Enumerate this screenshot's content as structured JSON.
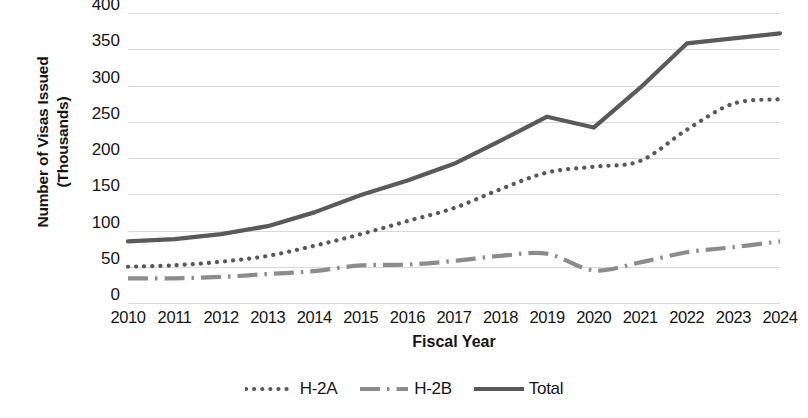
{
  "chart_data": {
    "type": "line",
    "title": "",
    "xlabel": "Fiscal Year",
    "ylabel": "Number of Visas Issued (Thousands)",
    "ylabel_line1": "Number of Visas Issued",
    "ylabel_line2": "(Thousands)",
    "categories": [
      "2010",
      "2011",
      "2012",
      "2013",
      "2014",
      "2015",
      "2016",
      "2017",
      "2018",
      "2019",
      "2020",
      "2021",
      "2022",
      "2023",
      "2024"
    ],
    "x": [
      2010,
      2011,
      2012,
      2013,
      2014,
      2015,
      2016,
      2017,
      2018,
      2019,
      2020,
      2021,
      2022,
      2023,
      2024
    ],
    "ylim": [
      0,
      400
    ],
    "yticks": [
      0,
      50,
      100,
      150,
      200,
      250,
      300,
      350,
      400
    ],
    "ytick_labels": [
      "0",
      "50",
      "100",
      "150",
      "200",
      "250",
      "300",
      "350",
      "400"
    ],
    "grid": true,
    "grid_color": "#d9d9d9",
    "legend_position": "bottom",
    "series": [
      {
        "name": "H-2A",
        "style": "dotted",
        "color": "#595959",
        "values": [
          50,
          52,
          57,
          65,
          79,
          95,
          113,
          131,
          157,
          180,
          188,
          196,
          239,
          275,
          281
        ]
      },
      {
        "name": "H-2B",
        "style": "dash-dot",
        "color": "#8c8c8c",
        "values": [
          34,
          34,
          36,
          40,
          44,
          52,
          53,
          58,
          65,
          68,
          45,
          56,
          70,
          77,
          85
        ]
      },
      {
        "name": "Total",
        "style": "solid",
        "color": "#5a5a5a",
        "values": [
          85,
          88,
          95,
          106,
          125,
          149,
          169,
          192,
          224,
          257,
          242,
          297,
          358,
          365,
          372
        ]
      }
    ]
  },
  "axis": {
    "x_title": "Fiscal Year",
    "y_title_line1": "Number of Visas Issued",
    "y_title_line2": "(Thousands)"
  },
  "legend": {
    "items": [
      {
        "label": "H-2A",
        "swatch": "dotted-line-swatch"
      },
      {
        "label": "H-2B",
        "swatch": "dash-dot-line-swatch"
      },
      {
        "label": "Total",
        "swatch": "solid-line-swatch"
      }
    ]
  }
}
